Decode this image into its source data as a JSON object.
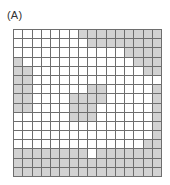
{
  "figure": {
    "label": "(A)",
    "grid": {
      "rows": 16,
      "cols": 16,
      "colors": {
        "filled": "#d2d2d2",
        "empty": "#ffffff",
        "line": "#6e6e6e"
      },
      "cells": [
        [
          0,
          0,
          0,
          0,
          0,
          0,
          0,
          1,
          1,
          1,
          1,
          1,
          1,
          1,
          1,
          1
        ],
        [
          0,
          0,
          0,
          0,
          0,
          0,
          0,
          0,
          1,
          1,
          1,
          1,
          1,
          1,
          1,
          1
        ],
        [
          0,
          0,
          0,
          0,
          0,
          0,
          0,
          0,
          0,
          0,
          0,
          0,
          1,
          1,
          1,
          1
        ],
        [
          1,
          0,
          0,
          0,
          0,
          0,
          0,
          0,
          0,
          0,
          0,
          0,
          0,
          1,
          1,
          1
        ],
        [
          1,
          1,
          0,
          0,
          0,
          0,
          0,
          0,
          0,
          0,
          0,
          0,
          0,
          0,
          1,
          1
        ],
        [
          1,
          1,
          0,
          0,
          0,
          0,
          0,
          0,
          0,
          0,
          0,
          0,
          0,
          0,
          0,
          0
        ],
        [
          1,
          1,
          0,
          0,
          0,
          0,
          0,
          0,
          1,
          1,
          0,
          0,
          0,
          0,
          0,
          1
        ],
        [
          1,
          1,
          0,
          0,
          0,
          0,
          1,
          1,
          1,
          1,
          0,
          0,
          0,
          0,
          0,
          1
        ],
        [
          1,
          1,
          0,
          0,
          0,
          0,
          1,
          1,
          1,
          0,
          0,
          0,
          0,
          0,
          0,
          1
        ],
        [
          0,
          0,
          0,
          0,
          0,
          0,
          1,
          1,
          1,
          0,
          0,
          0,
          0,
          0,
          0,
          1
        ],
        [
          0,
          0,
          0,
          0,
          0,
          0,
          0,
          0,
          0,
          0,
          0,
          0,
          0,
          0,
          0,
          1
        ],
        [
          0,
          0,
          0,
          0,
          0,
          0,
          0,
          0,
          0,
          0,
          0,
          0,
          0,
          0,
          0,
          1
        ],
        [
          0,
          0,
          0,
          0,
          0,
          0,
          0,
          0,
          0,
          0,
          0,
          0,
          0,
          0,
          1,
          1
        ],
        [
          1,
          1,
          1,
          1,
          1,
          1,
          1,
          1,
          0,
          1,
          1,
          1,
          1,
          1,
          1,
          1
        ],
        [
          1,
          1,
          1,
          1,
          1,
          1,
          1,
          1,
          1,
          1,
          1,
          1,
          1,
          1,
          1,
          1
        ],
        [
          1,
          1,
          1,
          1,
          1,
          1,
          1,
          1,
          1,
          1,
          1,
          1,
          1,
          1,
          1,
          1
        ]
      ]
    }
  }
}
